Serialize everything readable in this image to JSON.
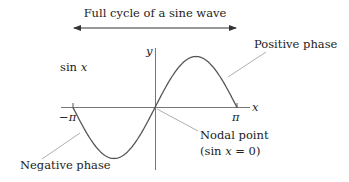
{
  "title": "Full cycle of a sine wave",
  "function_label": "sin x",
  "axes": {
    "x_label": "x",
    "y_label": "y"
  },
  "ticks": {
    "neg_pi": "−π",
    "pi": "π"
  },
  "annotations": {
    "positive_phase": "Positive phase",
    "negative_phase": "Negative phase",
    "nodal_point": "Nodal point",
    "nodal_condition": "(sin x = 0)"
  },
  "colors": {
    "curve": "#555555",
    "axis": "#777777",
    "leader": "#999999",
    "text": "#222222"
  }
}
